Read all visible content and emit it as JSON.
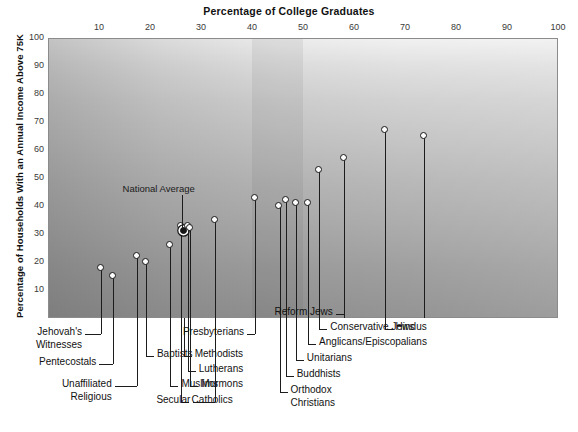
{
  "chart_data": {
    "type": "scatter",
    "title": "Percentage of College Graduates",
    "xlabel": "Percentage of College Graduates",
    "ylabel": "Percentage of Households With an Annual Income Above 75K",
    "xlim": [
      0,
      100
    ],
    "ylim": [
      0,
      100
    ],
    "xticks": [
      10,
      20,
      30,
      40,
      50,
      60,
      70,
      80,
      90,
      100
    ],
    "yticks": [
      10,
      20,
      30,
      40,
      50,
      60,
      70,
      80,
      90,
      100
    ],
    "grid": false,
    "legend": "none",
    "annotations": [
      {
        "text": "National Average",
        "x": 26,
        "y": 31,
        "style": "filled-marker-with-leader"
      }
    ],
    "points": [
      {
        "label": "Jehovah's Witnesses",
        "x": 10.4,
        "y": 18,
        "marker": "open"
      },
      {
        "label": "Pentecostals",
        "x": 12.8,
        "y": 15,
        "marker": "open"
      },
      {
        "label": "Unaffiliated Religious",
        "x": 17.4,
        "y": 22,
        "marker": "open"
      },
      {
        "label": "Baptists",
        "x": 19.2,
        "y": 20,
        "marker": "open"
      },
      {
        "label": "Muslims",
        "x": 24.0,
        "y": 26,
        "marker": "open"
      },
      {
        "label": "Catholics",
        "x": 26.0,
        "y": 33,
        "marker": "open"
      },
      {
        "label": "National Average",
        "x": 26.6,
        "y": 31,
        "marker": "filled"
      },
      {
        "label": "Mormons",
        "x": 27.4,
        "y": 33,
        "marker": "open"
      },
      {
        "label": "Lutherans",
        "x": 27.9,
        "y": 32,
        "marker": "open"
      },
      {
        "label": "Methodists",
        "x": 32.8,
        "y": 35,
        "marker": "open"
      },
      {
        "label": "Presbyterians",
        "x": 40.6,
        "y": 43,
        "marker": "open"
      },
      {
        "label": "Secular",
        "x": 45.4,
        "y": 40,
        "marker": "open"
      },
      {
        "label": "Orthodox Christians",
        "x": 46.6,
        "y": 42,
        "marker": "open"
      },
      {
        "label": "Buddhists",
        "x": 48.6,
        "y": 41,
        "marker": "open"
      },
      {
        "label": "Unitarians",
        "x": 51.0,
        "y": 41,
        "marker": "open"
      },
      {
        "label": "Anglicans/Episcopalians",
        "x": 53.2,
        "y": 53,
        "marker": "open"
      },
      {
        "label": "Conservative Jews",
        "x": 58.0,
        "y": 57,
        "marker": "open"
      },
      {
        "label": "Reform Jews",
        "x": 66.0,
        "y": 67,
        "marker": "open"
      },
      {
        "label": "Hindus",
        "x": 73.8,
        "y": 65,
        "marker": "open"
      }
    ]
  },
  "callouts": [
    {
      "name": "jehovahs-witnesses",
      "line1": "Jehovah's",
      "line2": "Witnesses"
    },
    {
      "name": "pentecostals",
      "line1": "Pentecostals",
      "line2": ""
    },
    {
      "name": "unaffiliated",
      "line1": "Unaffiliated",
      "line2": "Religious"
    },
    {
      "name": "baptists",
      "line1": "Baptists",
      "line2": ""
    },
    {
      "name": "muslims",
      "line1": "Muslims",
      "line2": ""
    },
    {
      "name": "catholics",
      "line1": "Catholics",
      "line2": ""
    },
    {
      "name": "methodists",
      "line1": "Methodists",
      "line2": ""
    },
    {
      "name": "lutherans",
      "line1": "Lutherans",
      "line2": ""
    },
    {
      "name": "mormons",
      "line1": "Mormons",
      "line2": ""
    },
    {
      "name": "secular",
      "line1": "Secular",
      "line2": ""
    },
    {
      "name": "presbyterians",
      "line1": "Presbyterians",
      "line2": ""
    },
    {
      "name": "orthodox-christians",
      "line1": "Orthodox",
      "line2": "Christians"
    },
    {
      "name": "buddhists",
      "line1": "Buddhists",
      "line2": ""
    },
    {
      "name": "unitarians",
      "line1": "Unitarians",
      "line2": ""
    },
    {
      "name": "anglicans",
      "line1": "Anglicans/Episcopalians",
      "line2": ""
    },
    {
      "name": "conservative-jews",
      "line1": "Conservative Jews",
      "line2": ""
    },
    {
      "name": "reform-jews",
      "line1": "Reform Jews",
      "line2": ""
    },
    {
      "name": "hindus",
      "line1": "Hindus",
      "line2": ""
    }
  ],
  "colors": {
    "marker_fill": "#fdfdfd",
    "marker_stroke": "#161616",
    "stem": "#1c1c1c",
    "frame": "#8b8b8b",
    "text": "#111111"
  }
}
